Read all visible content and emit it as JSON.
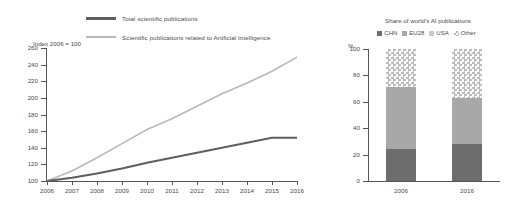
{
  "left_chart": {
    "axis_title": "Index  2006 = 100",
    "legend": [
      {
        "label": "Total scientific publications",
        "color": "#5e5e5e",
        "style": "thick"
      },
      {
        "label": "Scientific publications related to Artificial Intelligence",
        "color": "#b9b9b9",
        "style": "thin"
      }
    ]
  },
  "right_chart": {
    "title": "Share of world's AI publications",
    "unit_label": "%",
    "legend": [
      {
        "label": "CHN",
        "color": "#6d6d6d"
      },
      {
        "label": "EU28",
        "color": "#a8a8a8"
      },
      {
        "label": "USA",
        "color": "#c9c9c9"
      },
      {
        "label": "Other",
        "color": "checkered"
      }
    ]
  },
  "chart_data": [
    {
      "type": "line",
      "title": "Index 2006 = 100",
      "xlabel": "",
      "ylabel": "Index  2006 = 100",
      "x": [
        2006,
        2007,
        2008,
        2009,
        2010,
        2011,
        2012,
        2013,
        2014,
        2015,
        2016
      ],
      "xticklabels": [
        "2006",
        "2007",
        "2008",
        "2009",
        "2010",
        "2011",
        "2012",
        "2013",
        "2014",
        "2015",
        "2016"
      ],
      "ylim": [
        100,
        260
      ],
      "yticks": [
        100,
        120,
        140,
        160,
        180,
        200,
        220,
        240,
        260
      ],
      "grid": false,
      "legend_position": "top",
      "series": [
        {
          "name": "Total scientific publications",
          "color": "#5e5e5e",
          "values": [
            100,
            104,
            109,
            115,
            122,
            128,
            134,
            140,
            146,
            152,
            152
          ]
        },
        {
          "name": "Scientific publications related to Artificial Intelligence",
          "color": "#b9b9b9",
          "values": [
            100,
            112,
            128,
            145,
            162,
            175,
            190,
            205,
            218,
            232,
            249
          ]
        }
      ]
    },
    {
      "type": "bar",
      "title": "Share of world's AI publications",
      "xlabel": "",
      "ylabel": "%",
      "categories": [
        "2006",
        "2016"
      ],
      "ylim": [
        0,
        100
      ],
      "yticks": [
        0,
        20,
        40,
        60,
        80,
        100
      ],
      "stacked": true,
      "grid": false,
      "legend_position": "top",
      "series": [
        {
          "name": "CHN",
          "color": "#6d6d6d",
          "values": [
            24,
            28
          ]
        },
        {
          "name": "EU28",
          "color": "#a8a8a8",
          "values": [
            47,
            35
          ]
        },
        {
          "name": "USA",
          "color": "#c9c9c9",
          "values": [
            0,
            0
          ]
        },
        {
          "name": "Other",
          "color": "checkered",
          "values": [
            29,
            37
          ]
        }
      ]
    }
  ]
}
